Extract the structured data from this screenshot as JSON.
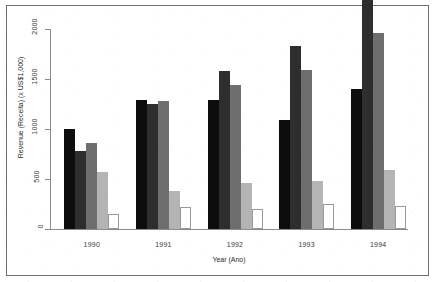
{
  "chart_data": {
    "type": "bar",
    "title": "",
    "xlabel": "Year (Ano)",
    "ylabel": "Revenue (Receita) (x US$1,000)",
    "categories": [
      "1990",
      "1991",
      "1992",
      "1993",
      "1994"
    ],
    "ylim": [
      0,
      2000
    ],
    "yticks": [
      0,
      500,
      1000,
      1500,
      2000
    ],
    "ytick_labels": [
      "0",
      "500",
      "1000",
      "1500",
      "2000"
    ],
    "grid": false,
    "legend": "none",
    "series": [
      {
        "name": "series-1",
        "color": "#0d0d0d",
        "values": [
          1000,
          1290,
          1290,
          1090,
          1400
        ]
      },
      {
        "name": "series-2",
        "color": "#2e2e2e",
        "values": [
          780,
          1250,
          1580,
          1830,
          2290
        ]
      },
      {
        "name": "series-3",
        "color": "#6e6e6e",
        "values": [
          860,
          1280,
          1440,
          1590,
          1960
        ]
      },
      {
        "name": "series-4",
        "color": "#b4b4b4",
        "values": [
          570,
          380,
          460,
          480,
          590
        ]
      },
      {
        "name": "series-5",
        "color": "#ffffff",
        "values": [
          150,
          220,
          200,
          250,
          230
        ]
      }
    ]
  },
  "axis": {
    "y_title": "Revenue (Receita) (x US$1,000)",
    "x_title": "Year (Ano)",
    "y_tick_labels": [
      "0",
      "500",
      "1000",
      "1500",
      "2000"
    ],
    "x_tick_labels": [
      "1990",
      "1991",
      "1992",
      "1993",
      "1994"
    ]
  },
  "colors": {
    "axis_line": "#8a8a8a",
    "frame": "#6f6f6f",
    "text": "#2b2b2b",
    "background": "#ffffff",
    "bar_outline": "#9a9a9a"
  }
}
